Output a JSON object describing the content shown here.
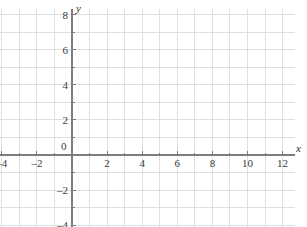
{
  "chart_data": {
    "type": "scatter",
    "title": "",
    "subtitle": "",
    "xlabel": "x",
    "ylabel": "y",
    "grid": true,
    "grid_spacing": 1,
    "legend": null,
    "annotations": [],
    "series": [],
    "values": [],
    "x": [],
    "xlim": [
      -4.3,
      12.7
    ],
    "ylim": [
      -4.3,
      8.3
    ],
    "x_tick_labels": [
      "–4",
      "–2",
      "0",
      "2",
      "4",
      "6",
      "8",
      "10",
      "12"
    ],
    "x_tick_values": [
      -4,
      -2,
      0,
      2,
      4,
      6,
      8,
      10,
      12
    ],
    "y_tick_labels": [
      "8",
      "6",
      "4",
      "2",
      "–2",
      "–4"
    ],
    "y_tick_values": [
      8,
      6,
      4,
      2,
      -2,
      -4
    ],
    "x_minor_ticks": [
      -3,
      -1,
      1,
      3,
      5,
      7,
      9,
      11,
      12
    ],
    "y_minor_ticks": [
      7,
      5,
      3,
      1,
      -1,
      -3
    ],
    "colors": {
      "grid": "#dcdcdc",
      "axis": "#7d7d7d",
      "text": "#3a3a3a",
      "background": "#ffffff"
    }
  }
}
